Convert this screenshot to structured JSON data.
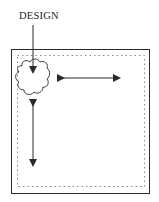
{
  "diagram": {
    "label": "DESIGN",
    "colors": {
      "ink": "#2a2a2a",
      "dotted": "#8a8a8a",
      "background": "#ffffff"
    },
    "elements": {
      "outer_frame": "square",
      "inner_border": "dotted",
      "design_motif": "cloud",
      "arrows": [
        "label-pointer",
        "horizontal-double-arrow",
        "vertical-double-arrow"
      ]
    }
  }
}
